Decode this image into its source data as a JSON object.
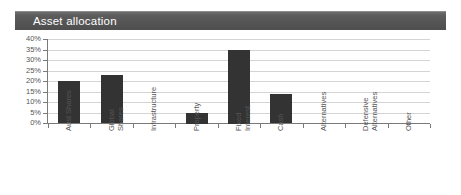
{
  "panel": {
    "title": "Asset allocation",
    "title_bar_color": "#555555",
    "title_text_color": "#ffffff"
  },
  "chart_data": {
    "type": "bar",
    "title": "Asset allocation",
    "xlabel": "",
    "ylabel": "",
    "ylim": [
      0,
      40
    ],
    "ytick_labels": [
      "40%",
      "35%",
      "30%",
      "25%",
      "20%",
      "15%",
      "10%",
      "5%",
      "0%"
    ],
    "ytick_values": [
      40,
      35,
      30,
      25,
      20,
      15,
      10,
      5,
      0
    ],
    "grid": true,
    "legend": false,
    "bar_color": "#333333",
    "categories": [
      "Aust Shares",
      "Global Shares",
      "Infrastructure",
      "Property",
      "Fixed Interest",
      "Cash",
      "Alternatives",
      "Defensive Alternatives",
      "Other"
    ],
    "category_lines": [
      [
        "Aust Shares"
      ],
      [
        "Global",
        "Shares"
      ],
      [
        "Infrastructure"
      ],
      [
        "Property"
      ],
      [
        "Fixed",
        "Interest"
      ],
      [
        "Cash"
      ],
      [
        "Alternatives"
      ],
      [
        "Defensive",
        "Alternatives"
      ],
      [
        "Other"
      ]
    ],
    "values": [
      20,
      23,
      0,
      5,
      35,
      14,
      0,
      0,
      0
    ],
    "value_labels": [
      "20%",
      "23%",
      "0%",
      "5%",
      "35%",
      "14%",
      "0%",
      "0%",
      "0%"
    ]
  }
}
